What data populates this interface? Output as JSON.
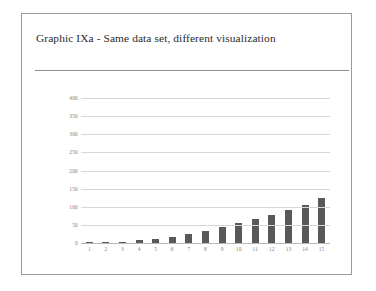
{
  "slide": {
    "title": "Graphic IXa - Same data set, different visualization"
  },
  "colors": {
    "bar": "#595959",
    "gridline": "#d7d7d7",
    "axis": "#b9b9b9",
    "tick_label": "#7d7d7d",
    "card_border": "#9a9a9a",
    "title_text": "#2b2b2b",
    "background": "#ffffff"
  },
  "chart_data": {
    "type": "bar",
    "title": "Graphic IXa - Same data set, different visualization",
    "xlabel": "",
    "ylabel": "",
    "categories": [
      "1",
      "2",
      "3",
      "4",
      "5",
      "6",
      "7",
      "8",
      "9",
      "10",
      "11",
      "12",
      "13",
      "14",
      "15"
    ],
    "values": [
      1,
      2,
      4,
      7,
      11,
      17,
      24,
      32,
      44,
      54,
      65,
      77,
      90,
      104,
      124
    ],
    "ylim": [
      0,
      400
    ],
    "yticks": [
      0,
      50,
      100,
      150,
      200,
      250,
      300,
      350,
      400
    ],
    "ytick_labels": [
      "0",
      "50",
      "100",
      "150",
      "200",
      "250",
      "300",
      "350",
      "400"
    ],
    "grid": true,
    "legend": false,
    "legend_position": "none",
    "series": [
      {
        "name": "series-1",
        "values": [
          1,
          2,
          4,
          7,
          11,
          17,
          24,
          32,
          44,
          54,
          65,
          77,
          90,
          104,
          124
        ]
      }
    ]
  }
}
